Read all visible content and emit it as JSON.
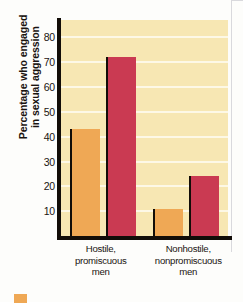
{
  "chart_data": {
    "type": "bar",
    "title": "",
    "xlabel": "",
    "ylabel": "Percentage who engaged in sexual aggression",
    "ylabel_lines": [
      "Percentage who engaged",
      "in sexual aggression"
    ],
    "categories": [
      "Hostile, promiscuous men",
      "Nonhostile, nonpromiscuous men"
    ],
    "category_lines": [
      [
        "Hostile,",
        "promiscuous",
        "men"
      ],
      [
        "Nonhostile,",
        "nonpromiscuous",
        "men"
      ]
    ],
    "series": [
      {
        "name": "orange-series",
        "color": "#efa855",
        "values": [
          43,
          11
        ]
      },
      {
        "name": "red-series",
        "color": "#ca3a52",
        "values": [
          72,
          24
        ]
      }
    ],
    "ylim": [
      0,
      87
    ],
    "yticks": [
      10,
      20,
      30,
      40,
      50,
      60,
      70,
      80
    ],
    "ytick_labels": [
      "10",
      "20",
      "30",
      "40",
      "50",
      "60",
      "70",
      "80"
    ],
    "grid": true,
    "grid_color": "#fdf8e6",
    "legend": "none",
    "plot_background": "#f7e7b3",
    "axis_color": "#120d08"
  },
  "legend": {
    "swatch_color": "#efa855"
  }
}
